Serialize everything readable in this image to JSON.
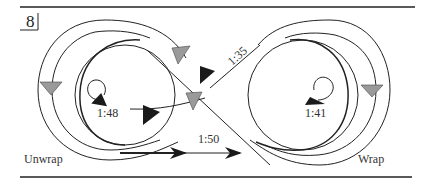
{
  "figure": {
    "number": "8"
  },
  "labels": {
    "unwrap": "Unwrap",
    "wrap": "Wrap",
    "time_left_center": "1:48",
    "time_right_center": "1:41",
    "time_diagonal": "1:35",
    "time_bottom": "1:50"
  },
  "colors": {
    "stroke": "#222222",
    "arrow_dark": "#1a1a1a",
    "arrow_gray": "#9a9a9a",
    "background": "#ffffff"
  }
}
